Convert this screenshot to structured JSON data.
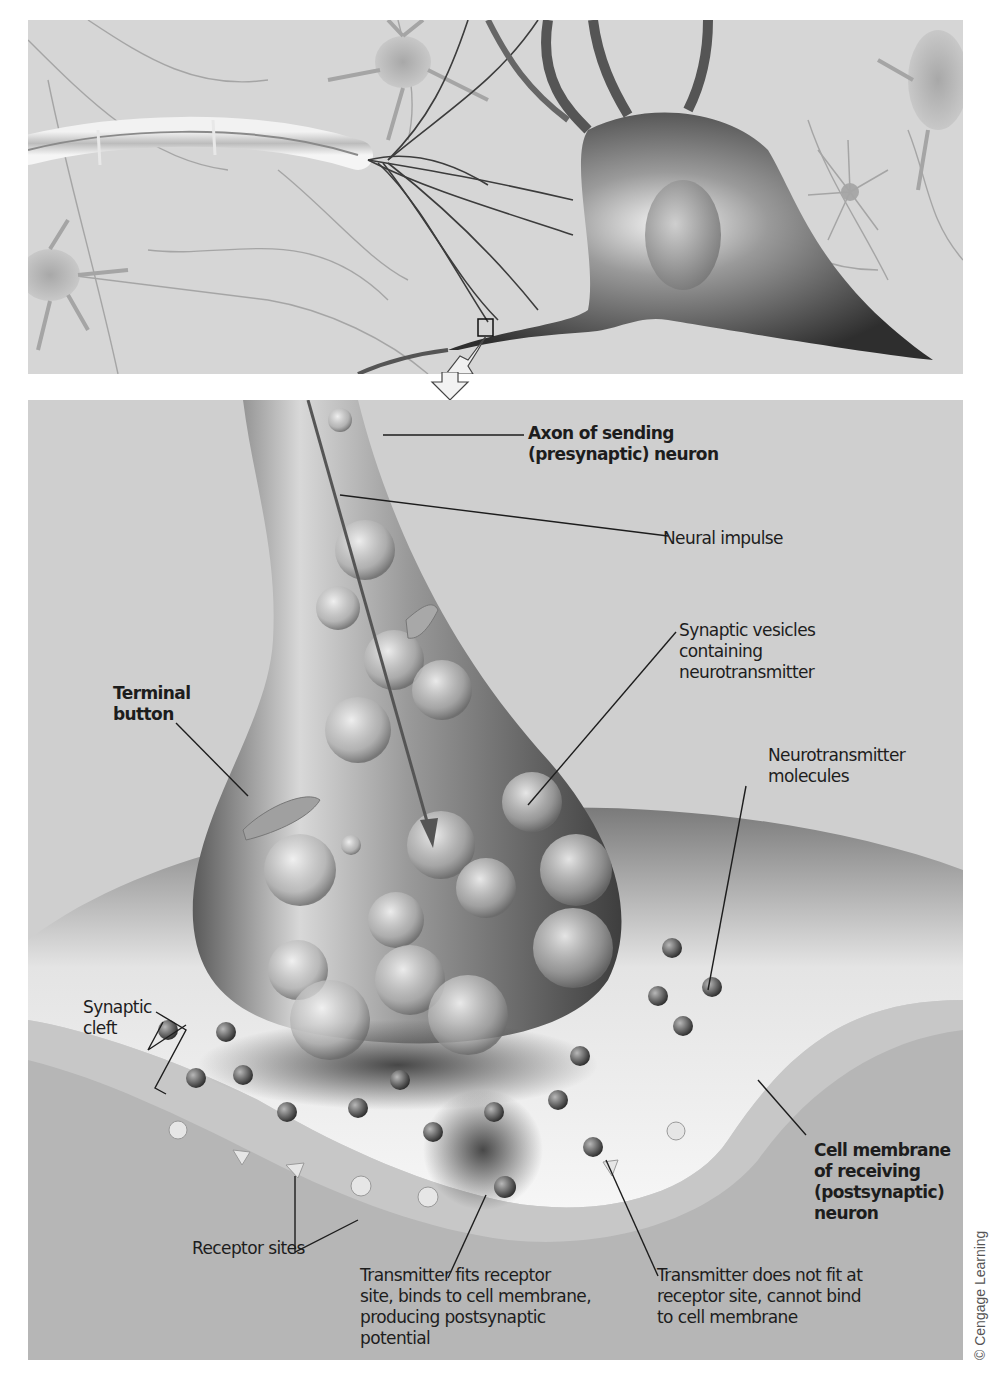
{
  "figure": {
    "panels": [
      {
        "id": "overview",
        "description": "Network of neurons with a highlighted synapse region (small square) and arrow pointing to enlarged view"
      },
      {
        "id": "enlarged-synapse",
        "description": "Enlarged view of terminal button releasing neurotransmitter across synaptic cleft"
      }
    ]
  },
  "labels": {
    "axon": "Axon of sending\n(presynaptic) neuron",
    "neural_impulse": "Neural impulse",
    "synaptic_vesicles": "Synaptic vesicles\ncontaining\nneurotransmitter",
    "terminal_button": "Terminal\nbutton",
    "neurotransmitter_molecules": "Neurotransmitter\nmolecules",
    "synaptic_cleft": "Synaptic\ncleft",
    "cell_membrane": "Cell membrane\nof receiving\n(postsynaptic)\nneuron",
    "receptor_sites": "Receptor sites",
    "transmitter_fits": "Transmitter fits receptor\nsite, binds to cell membrane,\nproducing postsynaptic\npotential",
    "transmitter_not_fit": "Transmitter does not fit at\nreceptor site, cannot bind\nto cell membrane"
  },
  "credit": "© Cengage Learning",
  "colors": {
    "background": "#cfcfcf",
    "neuron_dark": "#4a4a4a",
    "membrane_light": "#e8e8e8",
    "postsynaptic": "#b8b8b8",
    "label_text": "#1d1d1d"
  }
}
